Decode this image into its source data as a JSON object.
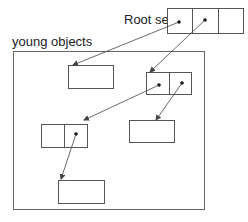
{
  "labels": {
    "root_set": "Root set",
    "young_objects": "young objects"
  },
  "colors": {
    "stroke": "#555555",
    "arrow": "#444444",
    "dot": "#111111",
    "background": "#ffffff"
  },
  "nodes": [
    {
      "id": "root-set",
      "cells": 3,
      "pointer_cells": [
        0,
        1
      ]
    },
    {
      "id": "object-a",
      "cells": 1,
      "pointer_cells": []
    },
    {
      "id": "object-b",
      "cells": 2,
      "pointer_cells": [
        0,
        1
      ]
    },
    {
      "id": "object-c",
      "cells": 1,
      "pointer_cells": []
    },
    {
      "id": "object-d",
      "cells": 2,
      "pointer_cells": [
        1
      ]
    },
    {
      "id": "object-e",
      "cells": 1,
      "pointer_cells": []
    }
  ],
  "edges": [
    {
      "from": "root-set.cell0",
      "to": "object-a"
    },
    {
      "from": "root-set.cell1",
      "to": "object-b"
    },
    {
      "from": "object-b.cell0",
      "to": "object-d"
    },
    {
      "from": "object-b.cell1",
      "to": "object-c"
    },
    {
      "from": "object-d.cell1",
      "to": "object-e"
    }
  ]
}
